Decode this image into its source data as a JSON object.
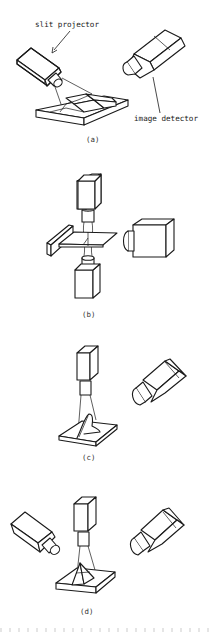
{
  "figure": {
    "panels": [
      {
        "id": "a",
        "caption": "(a)",
        "labels": {
          "slit_projector": "slit projector",
          "image_detector": "image detector"
        },
        "components": [
          "slit-projector",
          "image-detector",
          "stepped-block-object",
          "light-sheet"
        ]
      },
      {
        "id": "b",
        "caption": "(b)",
        "components": [
          "top-slit-projector",
          "bottom-slit-projector",
          "image-detector",
          "flat-plate-object"
        ]
      },
      {
        "id": "c",
        "caption": "(c)",
        "components": [
          "vertical-slit-projector",
          "image-detector",
          "bead-on-plate-object"
        ]
      },
      {
        "id": "d",
        "caption": "(d)",
        "components": [
          "left-image-detector",
          "vertical-slit-projector",
          "right-image-detector",
          "fillet-on-plate-object"
        ]
      }
    ],
    "colors": {
      "line": "#1a1a1a",
      "background": "#ffffff",
      "caption": "#333333"
    }
  }
}
